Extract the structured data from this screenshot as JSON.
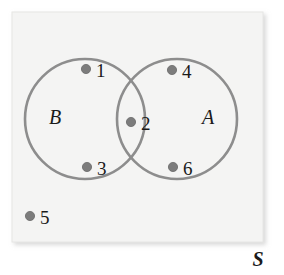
{
  "figure": {
    "type": "venn-diagram",
    "width": 284,
    "height": 275,
    "background_color": "#ffffff",
    "universe": {
      "label": "S",
      "shape": "rectangle",
      "fill_color": "#f4f4f3",
      "border_color": "#e6e6e4",
      "label_style": "bold-italic-serif",
      "label_position": "outside-bottom-right"
    },
    "circles": [
      {
        "id": "B",
        "label": "B",
        "label_x": 55,
        "label_y": 124,
        "cx": 85,
        "cy": 119,
        "r": 60,
        "stroke_color": "#8d8d8d",
        "stroke_width": 2.6,
        "fill": "none"
      },
      {
        "id": "A",
        "label": "A",
        "label_x": 208,
        "label_y": 124,
        "cx": 177,
        "cy": 119,
        "r": 60,
        "stroke_color": "#8d8d8d",
        "stroke_width": 2.6,
        "fill": "none"
      }
    ],
    "elements": [
      {
        "label": "1",
        "region": "B-only",
        "dot_x": 86,
        "dot_y": 69,
        "text_x": 96,
        "text_y": 77
      },
      {
        "label": "2",
        "region": "A-and-B",
        "dot_x": 131,
        "dot_y": 122,
        "text_x": 141,
        "text_y": 130
      },
      {
        "label": "3",
        "region": "B-only",
        "dot_x": 87,
        "dot_y": 167,
        "text_x": 97,
        "text_y": 175
      },
      {
        "label": "4",
        "region": "A-only",
        "dot_x": 172,
        "dot_y": 70,
        "text_x": 182,
        "text_y": 78
      },
      {
        "label": "5",
        "region": "outside-both",
        "dot_x": 30,
        "dot_y": 216,
        "text_x": 40,
        "text_y": 224
      },
      {
        "label": "6",
        "region": "A-only",
        "dot_x": 173,
        "dot_y": 167,
        "text_x": 183,
        "text_y": 175
      }
    ],
    "dot_style": {
      "radius": 4.6,
      "fill_color": "#7c7c7c",
      "stroke_color": "#6a6a6a"
    },
    "number_style": {
      "color": "#1a1a1a",
      "font_size": 19
    }
  },
  "chart_data": {
    "type": "venn",
    "title": "",
    "sets": [
      "A",
      "B"
    ],
    "universe": "S",
    "regions": {
      "B-only": [
        "1",
        "3"
      ],
      "A-and-B": [
        "2"
      ],
      "A-only": [
        "4",
        "6"
      ],
      "outside-both": [
        "5"
      ]
    },
    "counts": {
      "B-only": 2,
      "A-and-B": 1,
      "A-only": 2,
      "outside-both": 1,
      "universe-total": 6
    }
  }
}
